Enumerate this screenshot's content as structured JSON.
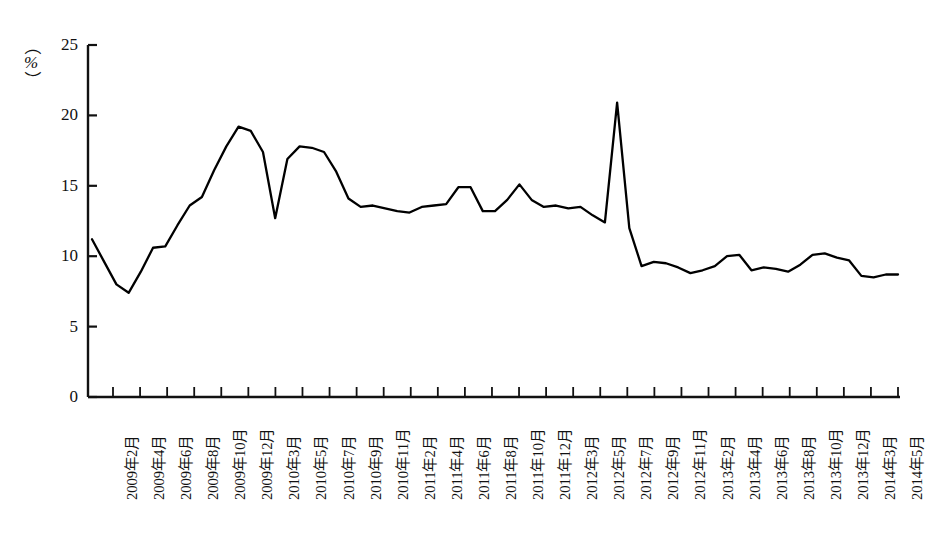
{
  "chart_data": {
    "type": "line",
    "title": "",
    "xlabel": "",
    "ylabel": "",
    "unit_label": "%",
    "ylim": [
      0,
      25
    ],
    "ytick_values": [
      0,
      5,
      10,
      15,
      20,
      25
    ],
    "ytick_labels": [
      "0",
      "5",
      "10",
      "15",
      "20",
      "25"
    ],
    "grid": false,
    "legend": "none",
    "xtick_labels": [
      "2009年2月",
      "2009年4月",
      "2009年6月",
      "2009年8月",
      "2009年10月",
      "2009年12月",
      "2010年3月",
      "2010年5月",
      "2010年7月",
      "2010年9月",
      "2010年11月",
      "2011年2月",
      "2011年4月",
      "2011年6月",
      "2011年8月",
      "2011年10月",
      "2011年12月",
      "2012年3月",
      "2012年5月",
      "2012年7月",
      "2012年9月",
      "2012年11月",
      "2013年2月",
      "2013年4月",
      "2013年6月",
      "2013年8月",
      "2013年10月",
      "2013年12月",
      "2014年3月",
      "2014年5月"
    ],
    "series": [
      {
        "name": "增速",
        "color": "#000000",
        "values": [
          11.2,
          9.6,
          8.0,
          7.4,
          8.9,
          10.6,
          10.7,
          12.2,
          13.6,
          14.2,
          16.1,
          17.8,
          19.2,
          18.9,
          17.4,
          12.7,
          16.9,
          17.8,
          17.7,
          17.4,
          16.0,
          14.1,
          13.5,
          13.6,
          13.4,
          13.2,
          13.1,
          13.5,
          13.6,
          13.7,
          14.9,
          14.9,
          13.2,
          13.2,
          14.0,
          15.1,
          14.0,
          13.5,
          13.6,
          13.4,
          13.5,
          12.9,
          12.4,
          20.9,
          12.0,
          9.3,
          9.6,
          9.5,
          9.2,
          8.8,
          9.0,
          9.3,
          10.0,
          10.1,
          9.0,
          9.2,
          9.1,
          8.9,
          9.4,
          10.1,
          10.2,
          9.9,
          9.7,
          8.6,
          8.5,
          8.7,
          8.7
        ]
      }
    ]
  },
  "axes": {
    "y_axis_name": "percent-axis",
    "x_axis_name": "month-axis"
  }
}
